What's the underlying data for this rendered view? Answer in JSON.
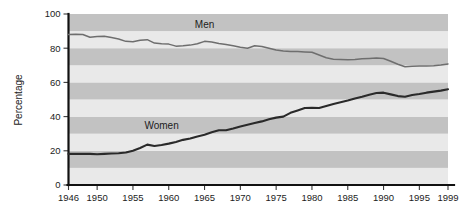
{
  "chart_data": {
    "type": "line",
    "title": "",
    "subtitle": "",
    "xlabel": "",
    "ylabel": "Percentage",
    "xlim": [
      1946,
      1999
    ],
    "ylim": [
      0,
      100
    ],
    "grid": "horizontal-alternating-bands",
    "legend_position": "inline-labels",
    "x_ticks": [
      1946,
      1950,
      1955,
      1960,
      1965,
      1970,
      1975,
      1980,
      1985,
      1990,
      1995,
      1999
    ],
    "x_tick_labels": [
      "1946",
      "1950",
      "1955",
      "1960",
      "1965",
      "1970",
      "1975",
      "1980",
      "1985",
      "1990",
      "1995",
      "1999"
    ],
    "y_ticks": [
      0,
      20,
      40,
      60,
      80,
      100
    ],
    "y_tick_labels": [
      "0",
      "20",
      "40",
      "60",
      "80",
      "100"
    ],
    "annotations": [
      {
        "text": "Men",
        "x": 1965,
        "y": 92
      },
      {
        "text": "Women",
        "x": 1959,
        "y": 33
      }
    ],
    "series": [
      {
        "name": "Men",
        "label": "Men",
        "color": "#6e6e6e",
        "x": [
          1946,
          1947,
          1948,
          1949,
          1950,
          1951,
          1952,
          1953,
          1954,
          1955,
          1956,
          1957,
          1958,
          1959,
          1960,
          1961,
          1962,
          1963,
          1964,
          1965,
          1966,
          1967,
          1968,
          1969,
          1970,
          1971,
          1972,
          1973,
          1974,
          1975,
          1976,
          1977,
          1978,
          1979,
          1980,
          1981,
          1982,
          1983,
          1984,
          1985,
          1986,
          1987,
          1988,
          1989,
          1990,
          1991,
          1992,
          1993,
          1994,
          1995,
          1996,
          1997,
          1998,
          1999
        ],
        "values": [
          88.0,
          88.2,
          88.0,
          86.4,
          86.8,
          87.0,
          86.2,
          85.4,
          84.0,
          83.8,
          84.6,
          85.0,
          83.0,
          82.6,
          82.4,
          81.2,
          81.4,
          81.8,
          82.6,
          84.0,
          83.6,
          82.8,
          82.2,
          81.4,
          80.6,
          80.0,
          81.4,
          81.0,
          80.0,
          79.0,
          78.4,
          78.0,
          78.0,
          77.8,
          77.6,
          76.0,
          74.4,
          73.6,
          73.4,
          73.2,
          73.4,
          73.8,
          74.0,
          74.2,
          74.0,
          72.4,
          70.6,
          69.2,
          69.4,
          69.6,
          69.6,
          69.8,
          70.2,
          70.8
        ]
      },
      {
        "name": "Women",
        "label": "Women",
        "color": "#2a2a2a",
        "x": [
          1946,
          1947,
          1948,
          1949,
          1950,
          1951,
          1952,
          1953,
          1954,
          1955,
          1956,
          1957,
          1958,
          1959,
          1960,
          1961,
          1962,
          1963,
          1964,
          1965,
          1966,
          1967,
          1968,
          1969,
          1970,
          1971,
          1972,
          1973,
          1974,
          1975,
          1976,
          1977,
          1978,
          1979,
          1980,
          1981,
          1982,
          1983,
          1984,
          1985,
          1986,
          1987,
          1988,
          1989,
          1990,
          1991,
          1992,
          1993,
          1994,
          1995,
          1996,
          1997,
          1998,
          1999
        ],
        "values": [
          18.2,
          18.2,
          18.2,
          18.2,
          18.0,
          18.2,
          18.4,
          18.6,
          19.0,
          20.0,
          21.6,
          23.6,
          22.8,
          23.4,
          24.2,
          25.2,
          26.4,
          27.2,
          28.4,
          29.4,
          30.8,
          32.0,
          32.0,
          33.0,
          34.2,
          35.2,
          36.2,
          37.2,
          38.4,
          39.4,
          40.0,
          42.2,
          43.6,
          45.0,
          45.2,
          45.0,
          46.2,
          47.4,
          48.4,
          49.4,
          50.6,
          51.6,
          52.8,
          53.8,
          54.0,
          53.0,
          52.0,
          51.6,
          52.6,
          53.2,
          54.0,
          54.6,
          55.2,
          56.0
        ]
      }
    ]
  },
  "colors": {
    "band_light": "#e9e9e9",
    "band_dark": "#c2c2c2",
    "axis": "#111111",
    "text": "#1c1c1c",
    "page_background": "#ffffff"
  }
}
